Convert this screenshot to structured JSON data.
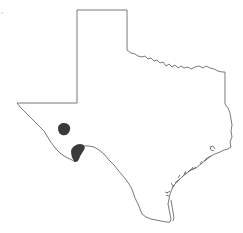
{
  "map": {
    "region": "Texas",
    "outline_color": "#6a6a6a",
    "range_color": "#3a3a3a",
    "background": "#ffffff",
    "ranges": [
      {
        "name": "range-area-north",
        "cx": 64,
        "cy": 129
      },
      {
        "name": "range-area-south",
        "cx": 77,
        "cy": 151
      }
    ]
  }
}
